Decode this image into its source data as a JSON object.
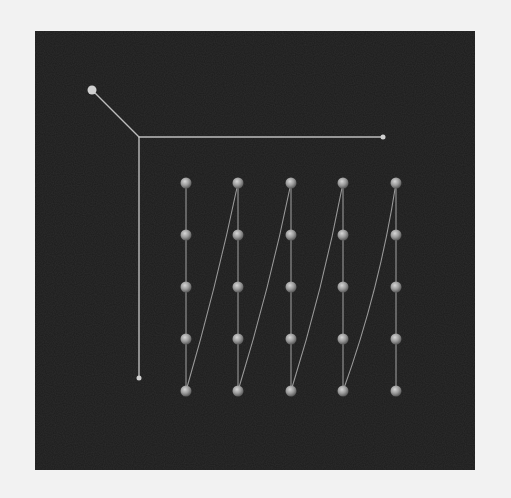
{
  "canvas": {
    "width": 511,
    "height": 498,
    "background": "#f2f2f2"
  },
  "panel": {
    "x": 35,
    "y": 31,
    "width": 440,
    "height": 439,
    "color": "#1c1c1c"
  },
  "colors": {
    "axis": "#bdbdbd",
    "axis_tip": "#d0d0d0",
    "path": "#9a9a9a",
    "sphere_light": "#d6d6d6",
    "sphere_mid": "#9c9c9c",
    "sphere_dark": "#5a5a5a"
  },
  "axes": {
    "origin": [
      139,
      137
    ],
    "x_axis_end": [
      383,
      137
    ],
    "y_axis_end": [
      139,
      378
    ],
    "z_axis_end": [
      92,
      90
    ],
    "z_tip_radius": 4.5,
    "x_tip_radius": 2.5,
    "y_tip_radius": 2.5
  },
  "grid": {
    "columns_x": [
      186,
      238,
      291,
      343,
      396
    ],
    "rows_y": [
      183,
      235,
      287,
      339,
      391
    ],
    "sphere_radius": 5.5
  },
  "path": {
    "order": "column-major serpentine: each column top-to-bottom, then diagonal from bottom of column to top of next column",
    "diagonal_bend": [
      4,
      5,
      6,
      10
    ]
  }
}
